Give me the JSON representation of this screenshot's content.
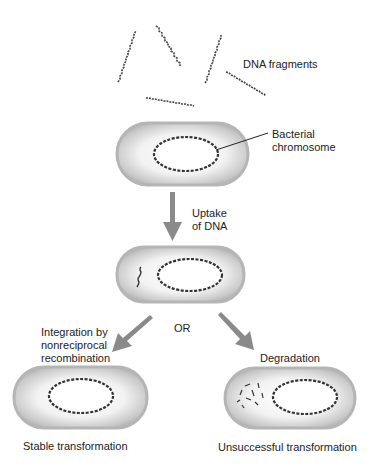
{
  "diagram": {
    "labels": {
      "dna_fragments": "DNA fragments",
      "bacterial_chromosome_line1": "Bacterial",
      "bacterial_chromosome_line2": "chromosome",
      "uptake_line1": "Uptake",
      "uptake_line2": "of DNA",
      "or": "OR",
      "integration_line1": "Integration by",
      "integration_line2": "nonreciprocal",
      "integration_line3": "recombination",
      "degradation": "Degradation",
      "stable": "Stable transformation",
      "unsuccessful": "Unsuccessful transformation"
    },
    "colors": {
      "arrow": "#8a8a8a",
      "cell_outline": "#b0b0b0",
      "cell_fill": "#dcdcdc",
      "dna": "#333333"
    }
  }
}
